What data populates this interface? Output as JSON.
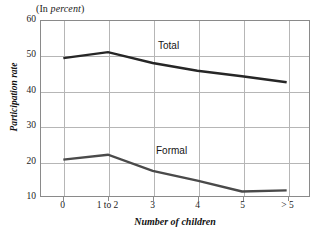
{
  "figure": {
    "units_note_prefix": "(In ",
    "units_note_italic": "percent",
    "units_note_suffix": ")"
  },
  "chart_data": {
    "type": "line",
    "title": "(In percent)",
    "xlabel": "Number of children",
    "ylabel": "Participation rate",
    "categories": [
      "0",
      "1 to 2",
      "3",
      "4",
      "5",
      "> 5"
    ],
    "series": [
      {
        "name": "Total",
        "color": "#262626",
        "values": [
          49.4,
          51.1,
          48.0,
          45.8,
          44.2,
          42.5
        ]
      },
      {
        "name": "Formal",
        "color": "#4a4a4a",
        "values": [
          20.4,
          21.8,
          17.2,
          14.4,
          11.3,
          11.6
        ]
      }
    ],
    "ylim": [
      10,
      60
    ],
    "yticks": [
      10,
      20,
      30,
      40,
      50,
      60
    ],
    "ytick_labels": [
      "10",
      "20",
      "30",
      "40",
      "50",
      "60"
    ],
    "grid": true,
    "legend_position": "inline-annotations",
    "annotations": [
      {
        "text": "Total",
        "series": "Total",
        "x_px": 157,
        "y_px": 40
      },
      {
        "text": "Formal",
        "series": "Formal",
        "x_px": 155,
        "y_px": 145
      }
    ]
  },
  "colors": {
    "frame": "#8a8a8a",
    "grid": "#b6b6b6",
    "text": "#1a1a1a",
    "background": "#ffffff"
  }
}
